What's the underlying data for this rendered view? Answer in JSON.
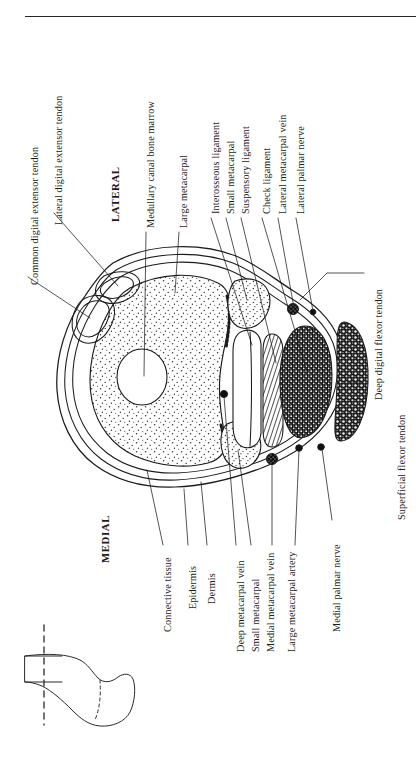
{
  "figure": {
    "kind": "anatomical-cross-section",
    "orientation_labels": [
      {
        "text": "LATERAL",
        "side": "upper"
      },
      {
        "text": "MEDIAL",
        "side": "lower"
      }
    ],
    "top_rule_color": "#262626",
    "line_color": "#1c1c1c",
    "fill_colors": {
      "page": "#ffffff",
      "bone_stipple": "#2b2b2b",
      "deep_flexor_tendon": "#141414",
      "superficial_flexor_tendon": "#1b1b1b",
      "vessel_solid": "#111111"
    }
  },
  "labels": {
    "upper_column": [
      {
        "id": "common-digital-extensor-tendon",
        "text": "Common digital extensor tendon"
      },
      {
        "id": "lateral-digital-extensor-tendon",
        "text": "Lateral digital extensor tendon"
      },
      {
        "id": "lateral",
        "text": "LATERAL",
        "bold": true
      },
      {
        "id": "medullary-canal-bone-marrow",
        "text": "Medullary canal bone marrow"
      },
      {
        "id": "large-metacarpal",
        "text": "Large metacarpal"
      },
      {
        "id": "interosseous-ligament",
        "text": "Interosseous ligament"
      },
      {
        "id": "small-metacarpal-upper",
        "text": "Small metacarpal"
      },
      {
        "id": "suspensory-ligament",
        "text": "Suspensory ligament"
      },
      {
        "id": "check-ligament",
        "text": "Check ligament"
      },
      {
        "id": "lateral-metacarpal-vein",
        "text": "Lateral metacarpal vein"
      },
      {
        "id": "lateral-palmar-nerve",
        "text": "Lateral palmar nerve"
      }
    ],
    "right_column": [
      {
        "id": "deep-digital-flexor-tendon",
        "text": "Deep digital flexor tendon"
      },
      {
        "id": "superficial-flexor-tendon",
        "text": "Superficial flexor tendon"
      }
    ],
    "lower_column": [
      {
        "id": "medial",
        "text": "MEDIAL",
        "bold": true
      },
      {
        "id": "connective-tissue",
        "text": "Connective tissue"
      },
      {
        "id": "epidermis",
        "text": "Epidermis"
      },
      {
        "id": "dermis",
        "text": "Dermis"
      },
      {
        "id": "deep-metacarpal-vein",
        "text": "Deep metacarpal vein"
      },
      {
        "id": "small-metacarpal-lower",
        "text": "Small metacarpal"
      },
      {
        "id": "medial-metacarpal-vein",
        "text": "Medial metacarpal vein"
      },
      {
        "id": "large-metacarpal-artery",
        "text": "Large metacarpal artery"
      },
      {
        "id": "medial-palmar-nerve",
        "text": "Medial palmar nerve"
      }
    ]
  },
  "inset": {
    "id": "limb-orientation-inset",
    "description": "Small line drawing of the distal limb and hoof with dashed section-plane lines",
    "section_plane_style": "dashed"
  }
}
